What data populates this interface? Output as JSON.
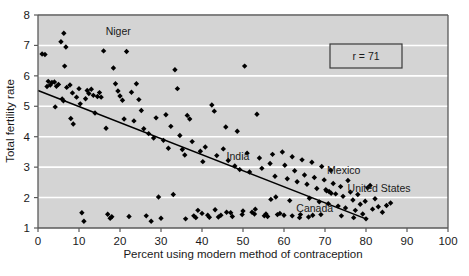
{
  "chart_data": {
    "type": "scatter",
    "title": "",
    "xlabel": "Percent using modern method of contraception",
    "ylabel": "Total fertility rate",
    "xlim": [
      0,
      100
    ],
    "ylim": [
      1,
      8
    ],
    "xticks": [
      0,
      10,
      20,
      30,
      40,
      50,
      60,
      70,
      80,
      90,
      100
    ],
    "yticks": [
      1,
      2,
      3,
      4,
      5,
      6,
      7,
      8
    ],
    "grid": "horizontal-white-gridlines",
    "legend": "none",
    "plot_background": "#d4d4d4",
    "gridline_color": "#ffffff",
    "marker_color": "#000000",
    "marker_shape": "diamond",
    "annotation_box": {
      "text": "r = 71",
      "x": 75,
      "y": 6.6,
      "border_color": "#3a3a3a",
      "fill": "#d4d4d4"
    },
    "trend_line": {
      "type": "linear-fit",
      "x_start": 0,
      "y_start": 5.52,
      "x_end": 80,
      "y_end": 1.3,
      "color": "#000000"
    },
    "annotations": [
      {
        "label": "Niger",
        "x": 16.5,
        "y": 7.35
      },
      {
        "label": "India",
        "x": 46.0,
        "y": 3.25
      },
      {
        "label": "Mexico",
        "x": 70.5,
        "y": 2.78
      },
      {
        "label": "United States",
        "x": 75.5,
        "y": 2.18
      },
      {
        "label": "Canada",
        "x": 63.0,
        "y": 1.52
      }
    ],
    "points": [
      [
        1.0,
        6.72
      ],
      [
        1.7,
        6.7
      ],
      [
        2.5,
        5.82
      ],
      [
        2.2,
        5.65
      ],
      [
        3.0,
        5.7
      ],
      [
        3.4,
        5.78
      ],
      [
        4.0,
        5.8
      ],
      [
        4.5,
        5.66
      ],
      [
        5.0,
        5.72
      ],
      [
        4.2,
        4.98
      ],
      [
        5.6,
        7.12
      ],
      [
        6.3,
        7.4
      ],
      [
        6.8,
        6.95
      ],
      [
        6.5,
        6.32
      ],
      [
        5.9,
        5.24
      ],
      [
        6.2,
        5.18
      ],
      [
        7.0,
        5.62
      ],
      [
        7.8,
        5.7
      ],
      [
        8.4,
        5.44
      ],
      [
        8.0,
        4.6
      ],
      [
        8.6,
        4.42
      ],
      [
        9.4,
        5.3
      ],
      [
        10.0,
        5.58
      ],
      [
        10.3,
        5.08
      ],
      [
        10.7,
        1.5
      ],
      [
        11.2,
        1.22
      ],
      [
        11.6,
        5.25
      ],
      [
        12.0,
        5.52
      ],
      [
        12.4,
        5.42
      ],
      [
        13.0,
        5.56
      ],
      [
        13.5,
        5.36
      ],
      [
        13.9,
        4.78
      ],
      [
        14.5,
        5.32
      ],
      [
        15.0,
        5.45
      ],
      [
        15.4,
        5.3
      ],
      [
        16.0,
        6.82
      ],
      [
        16.6,
        4.28
      ],
      [
        17.0,
        1.45
      ],
      [
        17.6,
        1.32
      ],
      [
        18.0,
        1.37
      ],
      [
        18.4,
        6.26
      ],
      [
        18.9,
        5.74
      ],
      [
        19.5,
        5.5
      ],
      [
        20.0,
        5.34
      ],
      [
        20.6,
        5.2
      ],
      [
        21.0,
        4.58
      ],
      [
        21.6,
        6.8
      ],
      [
        22.2,
        1.38
      ],
      [
        22.8,
        5.46
      ],
      [
        23.4,
        4.52
      ],
      [
        24.0,
        5.74
      ],
      [
        24.6,
        5.22
      ],
      [
        25.2,
        4.86
      ],
      [
        25.8,
        4.26
      ],
      [
        26.4,
        1.4
      ],
      [
        27.0,
        4.1
      ],
      [
        27.6,
        1.22
      ],
      [
        28.2,
        3.96
      ],
      [
        28.8,
        4.62
      ],
      [
        29.4,
        2.02
      ],
      [
        30.0,
        1.32
      ],
      [
        30.6,
        3.88
      ],
      [
        31.2,
        4.72
      ],
      [
        31.8,
        3.62
      ],
      [
        32.4,
        4.34
      ],
      [
        33.0,
        2.1
      ],
      [
        33.4,
        6.2
      ],
      [
        34.0,
        5.58
      ],
      [
        34.6,
        4.04
      ],
      [
        35.2,
        3.58
      ],
      [
        35.8,
        3.4
      ],
      [
        36.4,
        4.7
      ],
      [
        37.0,
        4.58
      ],
      [
        37.6,
        3.84
      ],
      [
        38.0,
        1.4
      ],
      [
        38.5,
        1.34
      ],
      [
        39.0,
        1.58
      ],
      [
        39.6,
        3.52
      ],
      [
        40.2,
        3.18
      ],
      [
        40.8,
        3.66
      ],
      [
        41.4,
        1.42
      ],
      [
        41.8,
        1.35
      ],
      [
        42.4,
        5.04
      ],
      [
        43.0,
        4.84
      ],
      [
        43.6,
        3.38
      ],
      [
        44.0,
        1.36
      ],
      [
        44.6,
        1.42
      ],
      [
        45.2,
        3.6
      ],
      [
        45.8,
        4.32
      ],
      [
        46.4,
        3.22
      ],
      [
        47.0,
        1.5
      ],
      [
        47.4,
        1.38
      ],
      [
        48.0,
        3.04
      ],
      [
        48.6,
        4.18
      ],
      [
        49.2,
        2.92
      ],
      [
        49.8,
        1.44
      ],
      [
        50.4,
        6.32
      ],
      [
        51.0,
        3.46
      ],
      [
        51.6,
        2.84
      ],
      [
        52.2,
        1.52
      ],
      [
        52.8,
        1.46
      ],
      [
        53.4,
        4.74
      ],
      [
        54.0,
        3.3
      ],
      [
        54.6,
        2.96
      ],
      [
        55.2,
        1.4
      ],
      [
        55.6,
        1.46
      ],
      [
        56.0,
        1.38
      ],
      [
        56.6,
        3.12
      ],
      [
        57.2,
        3.42
      ],
      [
        57.8,
        2.7
      ],
      [
        58.4,
        1.44
      ],
      [
        59.0,
        1.48
      ],
      [
        59.6,
        3.5
      ],
      [
        60.2,
        3.06
      ],
      [
        60.8,
        2.62
      ],
      [
        61.4,
        1.9
      ],
      [
        62.0,
        3.34
      ],
      [
        62.6,
        2.88
      ],
      [
        63.2,
        2.52
      ],
      [
        63.8,
        1.34
      ],
      [
        64.4,
        3.24
      ],
      [
        65.0,
        2.74
      ],
      [
        65.6,
        2.44
      ],
      [
        66.2,
        1.98
      ],
      [
        66.8,
        3.16
      ],
      [
        67.4,
        2.66
      ],
      [
        68.0,
        2.3
      ],
      [
        68.6,
        1.86
      ],
      [
        69.2,
        3.02
      ],
      [
        69.8,
        2.58
      ],
      [
        70.4,
        2.22
      ],
      [
        70.8,
        1.8
      ],
      [
        71.4,
        2.9
      ],
      [
        72.0,
        2.46
      ],
      [
        72.6,
        2.12
      ],
      [
        73.2,
        1.72
      ],
      [
        73.8,
        2.36
      ],
      [
        74.4,
        2.04
      ],
      [
        75.0,
        1.66
      ],
      [
        75.6,
        2.56
      ],
      [
        76.2,
        2.18
      ],
      [
        76.8,
        1.92
      ],
      [
        77.4,
        1.58
      ],
      [
        78.0,
        2.1
      ],
      [
        78.6,
        1.78
      ],
      [
        79.2,
        1.46
      ],
      [
        79.8,
        1.88
      ],
      [
        80.4,
        2.32
      ],
      [
        81.0,
        2.4
      ],
      [
        81.6,
        1.62
      ],
      [
        82.2,
        1.96
      ],
      [
        83.0,
        1.7
      ],
      [
        84.0,
        1.52
      ],
      [
        85.0,
        1.74
      ],
      [
        86.0,
        1.82
      ],
      [
        71.0,
        2.2
      ],
      [
        71.5,
        2.14
      ],
      [
        70.2,
        2.26
      ],
      [
        69.0,
        1.44
      ],
      [
        67.0,
        1.42
      ],
      [
        64.0,
        1.44
      ],
      [
        60.0,
        1.42
      ],
      [
        58.0,
        2.02
      ],
      [
        56.8,
        1.94
      ],
      [
        53.0,
        1.62
      ],
      [
        50.0,
        1.56
      ],
      [
        46.0,
        1.52
      ],
      [
        43.2,
        1.6
      ],
      [
        40.0,
        1.48
      ],
      [
        36.0,
        1.3
      ],
      [
        62.0,
        1.4
      ],
      [
        66.0,
        1.36
      ],
      [
        74.0,
        1.4
      ],
      [
        77.0,
        1.34
      ],
      [
        80.0,
        1.3
      ]
    ]
  }
}
